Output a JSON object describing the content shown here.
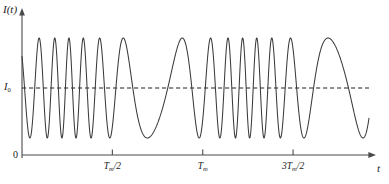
{
  "figure": {
    "name": "interference-intensity-vs-time",
    "background": "#ffffff",
    "stroke_color": "#3a3a3a",
    "axis_color": "#4a4a4a"
  },
  "labels": {
    "y_axis": "I(t)",
    "y_reference": "I",
    "y_reference_sub": "0",
    "x_axis": "t",
    "origin": "0"
  },
  "ticks": {
    "x": [
      {
        "label_main": "T",
        "label_sub": "m",
        "label_tail": "/2",
        "value": 0.5,
        "x_px": 108
      },
      {
        "label_main": "T",
        "label_sub": "m",
        "label_tail": "",
        "value": 1.0,
        "x_px": 200
      },
      {
        "label_main": "3T",
        "label_sub": "m",
        "label_tail": "/2",
        "value": 1.5,
        "x_px": 290
      }
    ]
  },
  "chart_data": {
    "type": "line",
    "title": "",
    "xlabel": "t",
    "ylabel": "I(t)",
    "subtitle": "Frequency-modulated (chirped) interference intensity signal oscillating about the mean level I0",
    "grid": false,
    "legend": "none",
    "xlim": [
      0,
      1.92
    ],
    "ylim": [
      0,
      1.32
    ],
    "x_unit": "T_m",
    "xticks": [
      0.5,
      1.0,
      1.5
    ],
    "xticklabels": [
      "T_m/2",
      "T_m",
      "3T_m/2"
    ],
    "yticks": [
      0,
      0.585
    ],
    "yticklabels": [
      "0",
      "I_0"
    ],
    "reference_line": {
      "name": "I0-mean-level",
      "y": 0.585,
      "style": "dashed",
      "label": "I_0"
    },
    "curve": {
      "name": "intensity",
      "model": "I(t) = I0 + A*cos(phi0 + 2*pi*fc*t + (dev/wm)*sin(wm*t - pi/2))",
      "description": "Sinusoidal carrier whose instantaneous frequency is modulated at period T_m; frequency is maximum near t = 0, T_m, 2T_m and minimum near t = T_m/2 and 3T_m/2.",
      "amplitude_upper": 1.17,
      "amplitude_lower": 0.0,
      "mean": 0.585,
      "carrier_cycles_per_Tm": 7.5,
      "modulation_index": 5.4,
      "modulation_period_Tm": 1.0,
      "n_samples": 3000
    },
    "annotations": []
  }
}
